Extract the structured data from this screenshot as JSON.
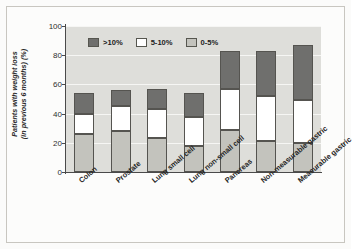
{
  "chart_data": {
    "type": "bar",
    "subtype": "stacked-bar",
    "title": "",
    "xlabel": "",
    "ylabel": "Patients with weight loss (in previous 6 months) (%)",
    "ylabel_line1": "Patients with weight loss",
    "ylabel_line2": "(in previous 6 months) (%)",
    "ylim": [
      0,
      100
    ],
    "yticks": [
      0,
      20,
      40,
      60,
      80,
      100
    ],
    "ytick_labels": [
      "0",
      "20",
      "40",
      "60",
      "80",
      "100"
    ],
    "grid": true,
    "legend_position": "top-left-inside",
    "categories": [
      "Colon",
      "Prostate",
      "Lung small cell",
      "Lung non-small cell",
      "Pancreas",
      "Non-measurable gastric",
      "Measurable gastric"
    ],
    "series": [
      {
        "name": "0-5%",
        "color": "#c3c3bd",
        "values": [
          26,
          28,
          23,
          18,
          29,
          21,
          20
        ]
      },
      {
        "name": "5-10%",
        "color": "#ffffff",
        "values": [
          14,
          17,
          20,
          20,
          28,
          31,
          29
        ]
      },
      {
        "name": ">10%",
        "color": "#6f6f6d",
        "values": [
          14,
          11,
          14,
          16,
          26,
          31,
          38
        ]
      }
    ],
    "cumulative_tops": {
      "0-5%": [
        26,
        28,
        23,
        18,
        29,
        21,
        20
      ],
      "5-10%": [
        40,
        45,
        43,
        38,
        57,
        52,
        49
      ],
      ">10%": [
        54,
        56,
        57,
        54,
        83,
        83,
        87
      ]
    },
    "legend": [
      {
        "label": ">10%",
        "color": "#6f6f6d",
        "key": "high"
      },
      {
        "label": "5-10%",
        "color": "#ffffff",
        "key": "mid"
      },
      {
        "label": "0-5%",
        "color": "#c3c3bd",
        "key": "low"
      }
    ],
    "colors": {
      "plot_background": "#dededa",
      "gridline": "#f6f6f4",
      "axis": "#4a4a4a",
      "bar_outline": "#555450",
      "figure_background": "#fcfcfb",
      "frame_border": "#c8c6c0",
      "text": "#262626"
    }
  }
}
